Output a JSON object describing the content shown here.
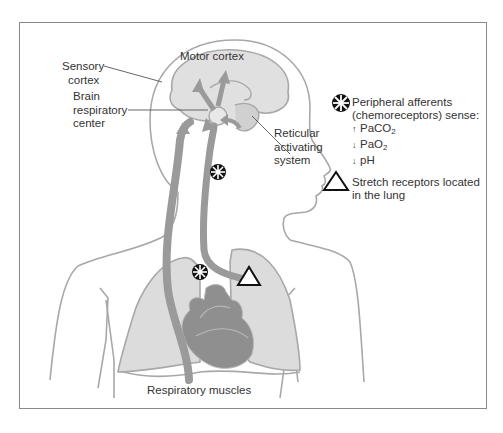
{
  "figure": {
    "labels": {
      "motor_cortex": "Motor cortex",
      "sensory_cortex_line1": "Sensory",
      "sensory_cortex_line2": "cortex",
      "brain_resp_line1": "Brain",
      "brain_resp_line2": "respiratory",
      "brain_resp_line3": "center",
      "reticular_line1": "Reticular",
      "reticular_line2": "activating",
      "reticular_line3": "system",
      "respiratory_muscles": "Respiratory muscles"
    },
    "legend": {
      "chemoreceptor": {
        "icon": "asterisk-burst-icon",
        "line1": "Peripheral afferents",
        "line2": "(chemoreceptors) sense:",
        "items": [
          {
            "arrow": "↑",
            "text": "PaCO",
            "sub": "2"
          },
          {
            "arrow": "↓",
            "text": "PaO",
            "sub": "2"
          },
          {
            "arrow": "↓",
            "text": "pH",
            "sub": ""
          }
        ]
      },
      "stretch": {
        "icon": "triangle-icon",
        "line1": "Stretch receptors located",
        "line2": "in the lung"
      }
    },
    "colors": {
      "outline": "#a8a8a8",
      "organ_fill": "#dcdcdc",
      "pathway": "#9a9a9a",
      "heart": "#8f8f8f",
      "frame": "#8a8a8a",
      "text": "#333333"
    }
  }
}
